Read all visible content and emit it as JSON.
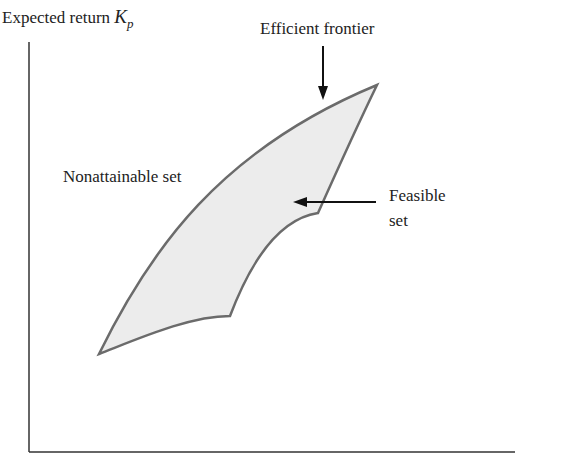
{
  "diagram": {
    "y_axis": {
      "label": "Expected return",
      "symbol": "K",
      "subscript": "p"
    },
    "x_axis": {
      "label": ""
    },
    "labels": {
      "efficient_frontier": "Efficient frontier",
      "nonattainable_set": "Nonattainable set",
      "feasible_line1": "Feasible",
      "feasible_line2": "set"
    },
    "colors": {
      "region_fill": "#ececec",
      "region_stroke": "#6b6b6b",
      "axis": "#333333",
      "arrow": "#111111"
    }
  }
}
